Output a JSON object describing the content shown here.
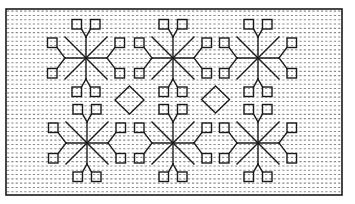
{
  "figure": {
    "width": 355,
    "height": 204,
    "background": "#ffffff",
    "ink_color": "#1a1a1a",
    "dot_color": "#8a8a8a",
    "frame": {
      "x": 6,
      "y": 9,
      "w": 336,
      "h": 186,
      "stroke_width": 1.6
    },
    "grid": {
      "spacing": 4.3,
      "dot_radius": 0.55
    },
    "motif_stroke_width": 1.4,
    "snowflake": {
      "diagonal_half_length": 21,
      "stem_length": 21,
      "square_size": 9.5,
      "square_offsets": {
        "vertical_arm": {
          "dx_inner": 4.5,
          "dx_outer": 14,
          "dy_inner": 29,
          "dy_outer": 38.5
        },
        "horizontal_arm": {
          "dx_inner": 29,
          "dx_outer": 38.5,
          "dy_inner": 10.5,
          "dy_outer": 20
        }
      }
    },
    "snowflakes": [
      {
        "name": "snowflake-top-left",
        "cx": 86,
        "cy": 58
      },
      {
        "name": "snowflake-top-middle",
        "cx": 173,
        "cy": 58
      },
      {
        "name": "snowflake-top-right",
        "cx": 258,
        "cy": 58
      },
      {
        "name": "snowflake-bottom-left",
        "cx": 87,
        "cy": 143
      },
      {
        "name": "snowflake-bottom-middle",
        "cx": 173,
        "cy": 143
      },
      {
        "name": "snowflake-bottom-right",
        "cx": 258,
        "cy": 143
      }
    ],
    "diamonds": [
      {
        "name": "diamond-left",
        "cx": 129.5,
        "cy": 100,
        "half_w": 14.5,
        "half_h": 14
      },
      {
        "name": "diamond-right",
        "cx": 215.5,
        "cy": 99.5,
        "half_w": 14,
        "half_h": 13.5
      }
    ]
  }
}
